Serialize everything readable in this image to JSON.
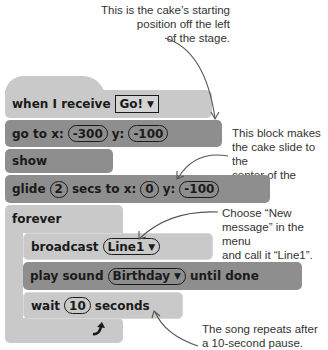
{
  "callouts": {
    "start_position": [
      "This is the cake’s starting",
      "position off the left",
      "of the stage."
    ],
    "slide_center": [
      "This block makes",
      "the cake slide to the",
      "center of the stage."
    ],
    "new_message": [
      "Choose “New",
      "message” in the menu",
      "and call it “Line1”."
    ],
    "song_repeat": [
      "The song repeats after",
      "a 10-second pause."
    ]
  },
  "blocks": {
    "when_receive": {
      "label": "when I receive",
      "message": "Go!",
      "dropdown_icon": "triangle-down"
    },
    "go_to": {
      "label_x": "go to x:",
      "x": "-300",
      "label_y": "y:",
      "y": "-100"
    },
    "show": {
      "label": "show"
    },
    "glide": {
      "label_a": "glide",
      "secs": "2",
      "label_b": "secs to x:",
      "x": "0",
      "label_y": "y:",
      "y": "-100"
    },
    "forever": {
      "label": "forever",
      "loop_icon": "curved-arrow-up"
    },
    "broadcast": {
      "label": "broadcast",
      "message": "Line1",
      "dropdown_icon": "triangle-down"
    },
    "play_sound": {
      "label": "play sound",
      "sound": "Birthday",
      "suffix": "until done",
      "dropdown_icon": "triangle-down"
    },
    "wait": {
      "label": "wait",
      "value": "10",
      "suffix": "seconds"
    }
  },
  "colors": {
    "light_block": "#c9c9c9",
    "dark_block": "#8e8e8e",
    "text": "#1a1a1a",
    "callout_text": "#333333",
    "arrow": "#555555"
  }
}
